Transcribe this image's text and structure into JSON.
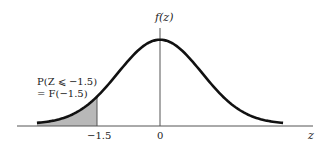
{
  "chart_data": {
    "type": "area",
    "title": "",
    "xlabel": "z",
    "ylabel": "f(z)",
    "distribution": "standard normal",
    "mean": 0,
    "sd": 1,
    "xlim": [
      -3.5,
      3.5
    ],
    "ticks": [
      {
        "value": -1.5,
        "label": "−1.5"
      },
      {
        "value": 0,
        "label": "0"
      }
    ],
    "shaded_region": {
      "from": -3.2,
      "to": -1.5
    },
    "annotation": {
      "line1": "P(Z ⩽ −1.5)",
      "line2": "= F(−1.5)"
    }
  },
  "colors": {
    "curve": "#111111",
    "axis": "#555555",
    "shade": "#b8b8b8"
  }
}
